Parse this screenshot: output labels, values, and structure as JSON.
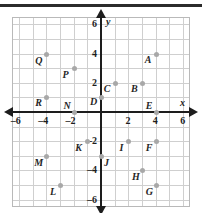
{
  "figure": {
    "kind": "coordinate-plane",
    "top_rule_color": "#2b2b2b",
    "grid_color": "#cfcfcf",
    "axis_color": "#1d1d1d",
    "point_color": "#a8a8a8",
    "label_color": "#262626"
  },
  "axes": {
    "x_name": "x",
    "y_name": "y",
    "xlim": [
      -6.5,
      6.5
    ],
    "ylim": [
      -6.5,
      6.5
    ],
    "x_ticks": [
      {
        "value": -6,
        "label": "–6"
      },
      {
        "value": -4,
        "label": "–4"
      },
      {
        "value": -2,
        "label": "–2"
      },
      {
        "value": 2,
        "label": "2"
      },
      {
        "value": 4,
        "label": "4"
      },
      {
        "value": 6,
        "label": "6"
      }
    ],
    "y_ticks": [
      {
        "value": 6,
        "label": "6"
      },
      {
        "value": 4,
        "label": "4"
      },
      {
        "value": 2,
        "label": "2"
      },
      {
        "value": -2,
        "label": "–2"
      },
      {
        "value": -4,
        "label": "–4"
      },
      {
        "value": -6,
        "label": "–6"
      }
    ]
  },
  "chart_data": {
    "type": "scatter",
    "title": "",
    "xlabel": "x",
    "ylabel": "y",
    "xlim": [
      -6.5,
      6.5
    ],
    "ylim": [
      -6.5,
      6.5
    ],
    "grid": true,
    "legend": "none",
    "points": [
      {
        "label": "A",
        "x": 4,
        "y": 4,
        "lx": -11,
        "ly": 1
      },
      {
        "label": "B",
        "x": 3,
        "y": 2,
        "lx": -11,
        "ly": 1
      },
      {
        "label": "C",
        "x": 1,
        "y": 2,
        "lx": -11,
        "ly": 1
      },
      {
        "label": "D",
        "x": 0,
        "y": 1,
        "lx": -11,
        "ly": 0
      },
      {
        "label": "E",
        "x": 4,
        "y": 0,
        "lx": -10,
        "ly": -11
      },
      {
        "label": "F",
        "x": 4,
        "y": -2,
        "lx": -10,
        "ly": 2
      },
      {
        "label": "G",
        "x": 4,
        "y": -5,
        "lx": -10,
        "ly": 2
      },
      {
        "label": "H",
        "x": 3,
        "y": -4,
        "lx": -10,
        "ly": 2
      },
      {
        "label": "I",
        "x": 2,
        "y": -2,
        "lx": -9,
        "ly": 2
      },
      {
        "label": "J",
        "x": 0,
        "y": -3,
        "lx": 3,
        "ly": 2
      },
      {
        "label": "K",
        "x": -1,
        "y": -2,
        "lx": -12,
        "ly": 2
      },
      {
        "label": "L",
        "x": -3,
        "y": -5,
        "lx": -10,
        "ly": 2
      },
      {
        "label": "M",
        "x": -4,
        "y": -3,
        "lx": -12,
        "ly": 2
      },
      {
        "label": "N",
        "x": -2,
        "y": 0,
        "lx": -10,
        "ly": -11
      },
      {
        "label": "P",
        "x": -2,
        "y": 3,
        "lx": -11,
        "ly": 2
      },
      {
        "label": "Q",
        "x": -4,
        "y": 4,
        "lx": -11,
        "ly": 2
      },
      {
        "label": "R",
        "x": -4,
        "y": 1,
        "lx": -11,
        "ly": 1
      }
    ]
  }
}
